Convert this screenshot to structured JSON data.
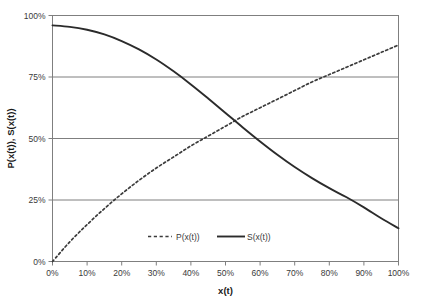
{
  "chart_data": {
    "type": "line",
    "title": "",
    "xlabel": "x(t)",
    "ylabel": "P(x(t)), S(x(t))",
    "xlim": [
      0,
      100
    ],
    "ylim": [
      0,
      100
    ],
    "grid": "horizontal",
    "legend_position": "bottom-inside",
    "x_ticks": [
      "0%",
      "10%",
      "20%",
      "30%",
      "40%",
      "50%",
      "60%",
      "70%",
      "80%",
      "90%",
      "100%"
    ],
    "x_tick_values": [
      0,
      10,
      20,
      30,
      40,
      50,
      60,
      70,
      80,
      90,
      100
    ],
    "y_ticks": [
      "0%",
      "25%",
      "50%",
      "75%",
      "100%"
    ],
    "y_tick_values": [
      0,
      25,
      50,
      75,
      100
    ],
    "x": [
      0,
      5,
      10,
      15,
      20,
      25,
      30,
      35,
      40,
      45,
      50,
      55,
      60,
      65,
      70,
      75,
      80,
      85,
      90,
      95,
      100
    ],
    "series": [
      {
        "name": "P(x(t))",
        "style": "dashed",
        "color": "#3b3b3b",
        "values": [
          0,
          8,
          15,
          21.5,
          27.5,
          33,
          38,
          42.5,
          47,
          51,
          55,
          59,
          62.5,
          66,
          69.5,
          73,
          76,
          79,
          82,
          85,
          88
        ]
      },
      {
        "name": "S(x(t))",
        "style": "solid",
        "color": "#2b2b2b",
        "values": [
          96,
          95.4,
          94.2,
          92.3,
          89.6,
          86.2,
          82.1,
          77.3,
          72.0,
          66.3,
          60.4,
          54.5,
          48.8,
          43.4,
          38.4,
          33.9,
          29.8,
          26.1,
          22.0,
          17.6,
          13.5
        ]
      }
    ],
    "annotations": []
  },
  "legend": {
    "entries": [
      {
        "label": "P(x(t))",
        "style": "dashed"
      },
      {
        "label": "S(x(t))",
        "style": "solid"
      }
    ]
  },
  "colors": {
    "plot_border": "#7f7f7f",
    "gridline": "#7f7f7f",
    "axis_line": "#7f7f7f",
    "tick_text": "#3a3a3a",
    "title_text": "#1a1a1a",
    "background": "#ffffff",
    "series_p": "#3b3b3b",
    "series_s": "#2b2b2b"
  }
}
